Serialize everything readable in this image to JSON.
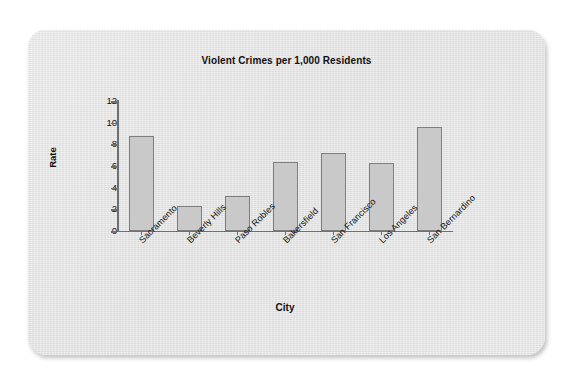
{
  "chart_data": {
    "type": "bar",
    "title": "Violent Crimes per 1,000 Residents",
    "xlabel": "City",
    "ylabel": "Rate",
    "categories": [
      "Sacramento",
      "Beverly Hills",
      "Paso Robles",
      "Bakersfield",
      "San Francisco",
      "Los Angeles",
      "San Bernardino"
    ],
    "values": [
      8.8,
      2.3,
      3.2,
      6.4,
      7.2,
      6.3,
      9.6
    ],
    "ylim": [
      0,
      12
    ],
    "yticks": [
      0,
      2,
      4,
      6,
      8,
      10,
      12
    ],
    "grid": false,
    "legend": null,
    "bar_color": "#c9c9c9",
    "bar_border_color": "#7e7e7e",
    "axis_color": "#6f6f6f",
    "background_color": "#e8e8e8"
  }
}
